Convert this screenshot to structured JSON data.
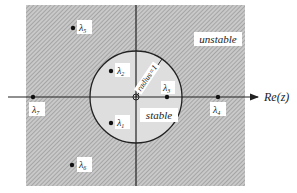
{
  "diagram": {
    "axis": {
      "horizontal_label": "Re(z)"
    },
    "regions": {
      "inside_label": "stable",
      "outside_label": "unstable"
    },
    "circle": {
      "radius_label": "radius=1"
    },
    "eigenvalues": [
      {
        "name": "λ1",
        "sub": "1",
        "region": "stable"
      },
      {
        "name": "λ2",
        "sub": "2",
        "region": "stable"
      },
      {
        "name": "λ3",
        "sub": "3",
        "region": "stable"
      },
      {
        "name": "λ4",
        "sub": "4",
        "region": "unstable"
      },
      {
        "name": "λ5",
        "sub": "5",
        "region": "unstable"
      },
      {
        "name": "λ6",
        "sub": "6",
        "region": "unstable"
      },
      {
        "name": "λ7",
        "sub": "7",
        "region": "unstable"
      }
    ],
    "colors": {
      "hatch_bg": "#c8c8c8",
      "hatch_line": "#8a8a8a",
      "circle_fill": "#dcdcdc",
      "line": "#222222"
    }
  }
}
